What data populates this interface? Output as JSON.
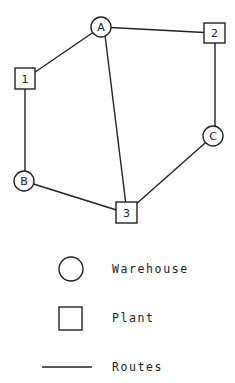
{
  "diagram": {
    "nodes": [
      {
        "id": "A",
        "type": "warehouse",
        "label": "A",
        "x": 101,
        "y": 27
      },
      {
        "id": "2",
        "type": "plant",
        "label": "2",
        "x": 214,
        "y": 33
      },
      {
        "id": "1",
        "type": "plant",
        "label": "1",
        "x": 25,
        "y": 79
      },
      {
        "id": "C",
        "type": "warehouse",
        "label": "C",
        "x": 213,
        "y": 136
      },
      {
        "id": "B",
        "type": "warehouse",
        "label": "B",
        "x": 24,
        "y": 181
      },
      {
        "id": "3",
        "type": "plant",
        "label": "3",
        "x": 126,
        "y": 213
      }
    ],
    "edges": [
      {
        "from": "A",
        "to": "2"
      },
      {
        "from": "A",
        "to": "1"
      },
      {
        "from": "A",
        "to": "3"
      },
      {
        "from": "1",
        "to": "B"
      },
      {
        "from": "2",
        "to": "C"
      },
      {
        "from": "B",
        "to": "3"
      },
      {
        "from": "C",
        "to": "3"
      }
    ]
  },
  "legend": {
    "items": [
      {
        "symbol": "circle",
        "label": "Warehouse"
      },
      {
        "symbol": "square",
        "label": "Plant"
      },
      {
        "symbol": "line",
        "label": "Routes"
      }
    ]
  }
}
